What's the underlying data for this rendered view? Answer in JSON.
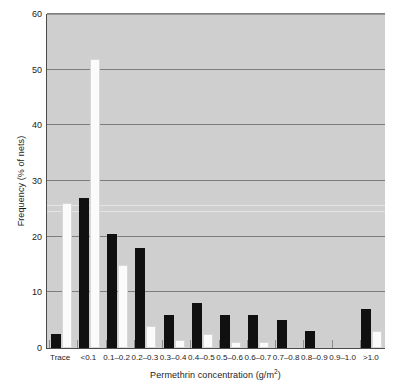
{
  "chart_data": {
    "type": "bar",
    "title": "",
    "xlabel": "Permethrin concentration (g/m2)",
    "xlabel_prefix": "Permethrin concentration (g/m",
    "xlabel_exponent": "2",
    "xlabel_suffix": ")",
    "ylabel": "Frequency (% of nets)",
    "ylim": [
      0,
      60
    ],
    "yticks": [
      0,
      10,
      20,
      30,
      40,
      50,
      60
    ],
    "ytick_labels": [
      "0",
      "10",
      "20",
      "30",
      "40",
      "50",
      "60"
    ],
    "grid": true,
    "legend": "none",
    "categories": [
      "Trace",
      "<0.1",
      "0.1–0.2",
      "0.2–0.3",
      "0.3–0.4",
      "0.4–0.5",
      "0.5–0.6",
      "0.6–0.7",
      "0.7–0.8",
      "0.8–0.9",
      "0.9–1.0",
      ">1.0"
    ],
    "series": [
      {
        "name": "black-series",
        "color": "#101010",
        "values": [
          2.5,
          27.0,
          20.5,
          18.0,
          6.0,
          8.0,
          6.0,
          6.0,
          5.0,
          3.0,
          0.0,
          7.0
        ]
      },
      {
        "name": "white-series",
        "color": "#fbfbfb",
        "values": [
          26.0,
          52.0,
          15.0,
          4.0,
          1.5,
          2.5,
          1.0,
          1.0,
          0.0,
          0.0,
          0.0,
          3.0
        ]
      }
    ],
    "plot_background": "#cfcfcf",
    "gridline_color": "#7d7d7d"
  }
}
